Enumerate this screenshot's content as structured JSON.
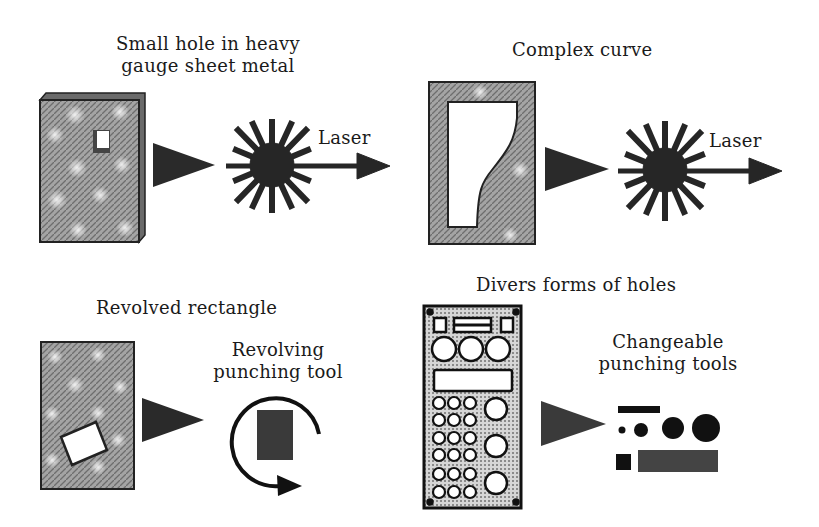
{
  "panels": [
    {
      "id": "small-hole",
      "title_line1": "Small hole in heavy",
      "title_line2": "gauge sheet metal",
      "process_label": "Laser",
      "process": "laser"
    },
    {
      "id": "complex-curve",
      "title": "Complex curve",
      "process_label": "Laser",
      "process": "laser"
    },
    {
      "id": "revolved-rectangle",
      "title": "Revolved rectangle",
      "tool_line1": "Revolving",
      "tool_line2": "punching tool",
      "process": "revolving-punch"
    },
    {
      "id": "divers-holes",
      "title": "Divers forms of holes",
      "tool_line1": "Changeable",
      "tool_line2": "punching tools",
      "process": "changeable-punch"
    }
  ],
  "colors": {
    "ink": "#1a1a1a",
    "sheet": "#9a9a9a",
    "sheet_light": "#c8c8c8",
    "panel_fill": "#b0b0b0"
  }
}
